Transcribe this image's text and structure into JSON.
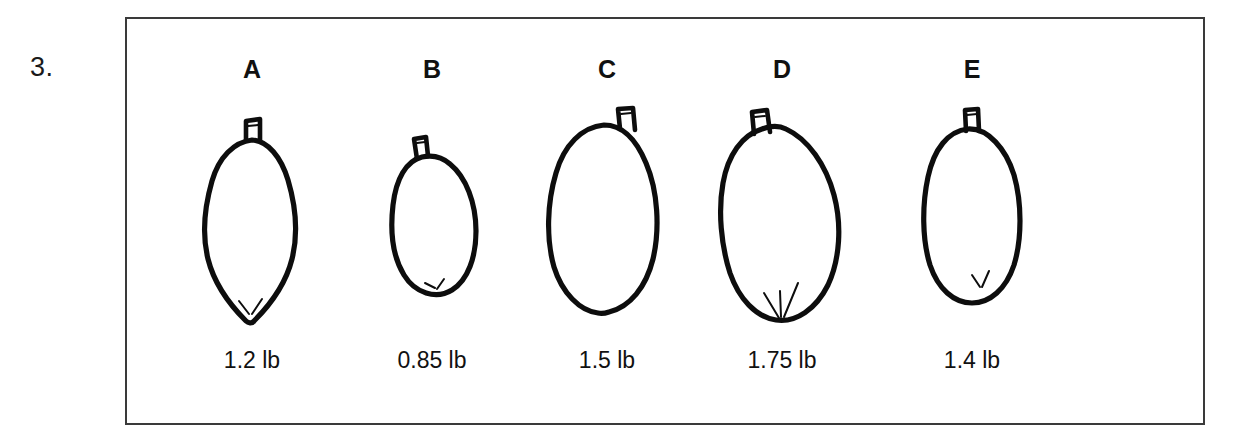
{
  "question": {
    "number_label": "3."
  },
  "panel": {
    "border_color": "#3a3a3a",
    "background_color": "#ffffff"
  },
  "ink_color": "#0d0d0d",
  "specimens": [
    {
      "letter": "A",
      "weight": "1.2 lb",
      "weight_value": 1.2,
      "unit": "lb",
      "shape": "narrow-pear-pointed-bottom",
      "stem_position": "top-center"
    },
    {
      "letter": "B",
      "weight": "0.85 lb",
      "weight_value": 0.85,
      "unit": "lb",
      "shape": "small-pear-rounded-bottom",
      "stem_position": "top-left"
    },
    {
      "letter": "C",
      "weight": "1.5 lb",
      "weight_value": 1.5,
      "unit": "lb",
      "shape": "large-round-oval",
      "stem_position": "top-right"
    },
    {
      "letter": "D",
      "weight": "1.75 lb",
      "weight_value": 1.75,
      "unit": "lb",
      "shape": "largest-tilted-oval",
      "stem_position": "top-left"
    },
    {
      "letter": "E",
      "weight": "1.4 lb",
      "weight_value": 1.4,
      "unit": "lb",
      "shape": "medium-ovoid",
      "stem_position": "top-center-left"
    }
  ]
}
